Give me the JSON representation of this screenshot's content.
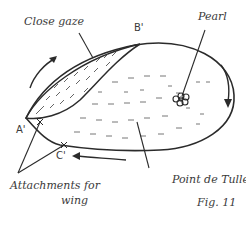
{
  "figure": {
    "caption": "Fig. 11",
    "labels": {
      "close_gaze": "Close gaze",
      "pearl": "Pearl",
      "b_prime": "B'",
      "a_prime": "A'",
      "c_prime": "C'",
      "attachments_line1": "Attachments for",
      "attachments_line2": "wing",
      "point_de_tulle": "Point de Tulle"
    },
    "colors": {
      "ink": "#2b2b2b",
      "text": "#3a3a3a",
      "background": "#ffffff"
    }
  }
}
